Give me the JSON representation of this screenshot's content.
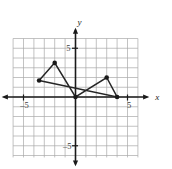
{
  "figure": {
    "name": "coordinate-plane-polygon",
    "background_color": "#ffffff",
    "grid_color": "#a9a9a9",
    "axis_color": "#1a1a1a",
    "shape_color": "#262626",
    "vertex_color": "#1a1a1a"
  },
  "axes": {
    "x_label": "x",
    "y_label": "y",
    "x_ticks": [
      {
        "value": -5,
        "label": "5",
        "prefix": "–"
      },
      {
        "value": 5,
        "label": "5",
        "prefix": ""
      }
    ],
    "y_ticks": [
      {
        "value": 5,
        "label": "5",
        "prefix": ""
      },
      {
        "value": -5,
        "label": "5",
        "prefix": "–"
      }
    ],
    "x_min": -7,
    "x_max": 7,
    "y_min": -7,
    "y_max": 7,
    "grid_step": 1,
    "grid_visible": true
  },
  "chart_data": {
    "type": "scatter",
    "title": "",
    "xlabel": "x",
    "ylabel": "y",
    "xlim": [
      -7,
      7
    ],
    "ylim": [
      -7,
      7
    ],
    "grid": true,
    "series": [
      {
        "name": "polygon",
        "closed": true,
        "points": [
          {
            "x": -3.5,
            "y": 1.7
          },
          {
            "x": -2,
            "y": 3.5
          },
          {
            "x": 0,
            "y": 0
          },
          {
            "x": 3,
            "y": 2
          },
          {
            "x": 4,
            "y": 0
          }
        ]
      }
    ]
  }
}
